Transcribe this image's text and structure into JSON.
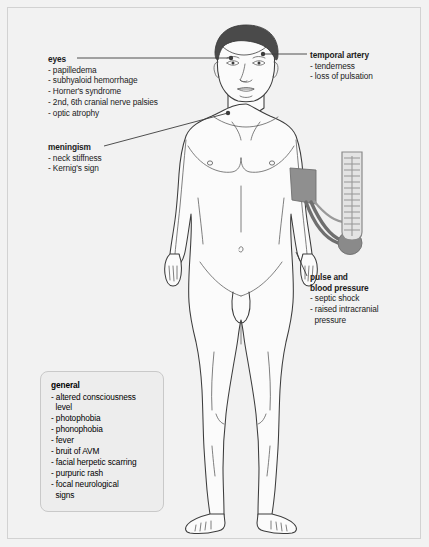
{
  "figure": {
    "colors": {
      "background": "#f2f2f2",
      "page_border": "#d2d2d2",
      "hair": "#4a4a4a",
      "skin_fill": "#fbfbfb",
      "outline": "#3c3c3c",
      "cuff": "#8f8f8f",
      "tube": "#6f6f6f",
      "bulb": "#8a8a8a",
      "manometer_fill": "#e4e4e4",
      "manometer_border": "#8a8a8a",
      "leader_line": "#3c3c3c",
      "box_fill": "#ededed",
      "box_border": "#c9c9c9",
      "text": "#1b1b1b"
    }
  },
  "callouts": {
    "eyes": {
      "title": "eyes",
      "items": [
        "- papilledema",
        "- subhyaloid hemorrhage",
        "- Horner's syndrome",
        "- 2nd, 6th cranial nerve palsies",
        "- optic atrophy"
      ]
    },
    "meningism": {
      "title": "meningism",
      "items": [
        "- neck stiffness",
        "- Kernig's sign"
      ]
    },
    "temporal_artery": {
      "title": "temporal artery",
      "items": [
        "- tenderness",
        "- loss of pulsation"
      ]
    },
    "pulse_blood_pressure": {
      "title_line1": "pulse and",
      "title_line2": "blood pressure",
      "items": [
        "- septic shock",
        "- raised intracranial",
        "  pressure"
      ]
    },
    "general": {
      "title": "general",
      "items": [
        "- altered consciousness",
        "  level",
        "- photophobia",
        "- phonophobia",
        "- fever",
        "- bruit of AVM",
        "- facial herpetic scarring",
        "- purpuric rash",
        "- focal neurological",
        "  signs"
      ]
    }
  }
}
